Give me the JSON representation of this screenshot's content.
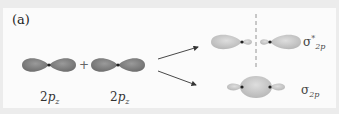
{
  "figure": {
    "panel_label": "(a)",
    "operator": "+",
    "atomic_orbitals": [
      {
        "label_prefix": "2",
        "label_main": "p",
        "label_sub": "z"
      },
      {
        "label_prefix": "2",
        "label_main": "p",
        "label_sub": "z"
      }
    ],
    "molecular_orbitals": [
      {
        "name": "antibonding",
        "symbol": "σ",
        "superscript": "*",
        "subscript": "2p"
      },
      {
        "name": "bonding",
        "symbol": "σ",
        "superscript": "",
        "subscript": "2p"
      }
    ],
    "colors": {
      "atomic_orbital": "#8a8a8a",
      "molecular_orbital": "#c9c9c9",
      "nucleus": "#222222",
      "node_line": "#777777",
      "arrow": "#333333"
    }
  }
}
